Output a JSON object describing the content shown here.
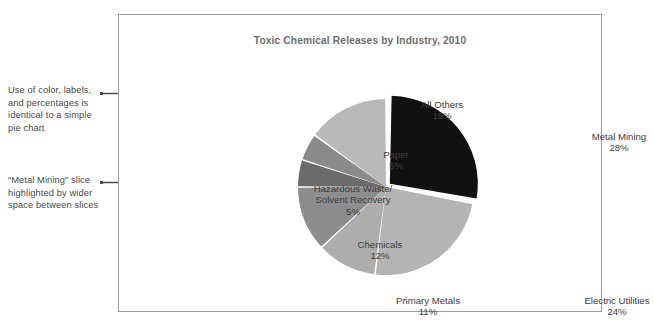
{
  "annotations": [
    {
      "id": "annotation-1",
      "text": "Use of color, labels, and percentages is identical to a simple pie chart",
      "arrow": "arrow-right-icon"
    },
    {
      "id": "annotation-2",
      "text": "“Metal Mining” slice highlighted by wider space between slices",
      "arrow": "arrow-right-icon"
    }
  ],
  "chart_data": {
    "type": "pie",
    "title": "Toxic Chemical Releases by Industry, 2010",
    "xlabel": "",
    "ylabel": "",
    "legend_position": "none",
    "grid": false,
    "units": "percent",
    "total": 100,
    "exploded_slice": "Metal Mining",
    "categories": [
      "Metal Mining",
      "Electric Utilities",
      "Primary Metals",
      "Chemicals",
      "Hazardous Waste/\nSolvent Recovery",
      "Paper",
      "All Others"
    ],
    "values": [
      28,
      24,
      11,
      12,
      5,
      5,
      15
    ],
    "slices": [
      {
        "name": "Metal Mining",
        "label": "Metal Mining",
        "value": 28,
        "percent_label": "28%",
        "color": "#111111",
        "exploded": true
      },
      {
        "name": "Electric Utilities",
        "label": "Electric Utilities",
        "value": 24,
        "percent_label": "24%",
        "color": "#b4b4b4",
        "exploded": false
      },
      {
        "name": "Primary Metals",
        "label": "Primary Metals",
        "value": 11,
        "percent_label": "11%",
        "color": "#adadad",
        "exploded": false
      },
      {
        "name": "Chemicals",
        "label": "Chemicals",
        "value": 12,
        "percent_label": "12%",
        "color": "#8d8d8d",
        "exploded": false
      },
      {
        "name": "Hazardous Waste/Solvent Recovery",
        "label": "Hazardous Waste/\nSolvent Recovery",
        "value": 5,
        "percent_label": "5%",
        "color": "#6b6b6b",
        "exploded": false
      },
      {
        "name": "Paper",
        "label": "Paper",
        "value": 5,
        "percent_label": "5%",
        "color": "#8a8a8a",
        "exploded": false
      },
      {
        "name": "All Others",
        "label": "All Others",
        "value": 15,
        "percent_label": "15%",
        "color": "#b9b9b9",
        "exploded": false
      }
    ]
  },
  "colors": {
    "frame_border": "#9a9a9a",
    "title_text": "#6d6d6d",
    "label_text": "#3d3d3d",
    "annotation_text": "#4a4a4a",
    "slice_divider": "#ffffff",
    "background": "#ffffff"
  }
}
